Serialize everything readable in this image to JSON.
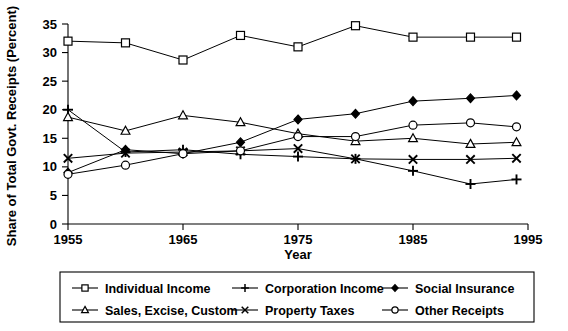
{
  "chart_data": {
    "type": "line",
    "title": "",
    "xlabel": "Year",
    "ylabel": "Share of Total Govt. Receipts (Percent)",
    "xlim": [
      1955,
      1995
    ],
    "ylim": [
      0,
      35
    ],
    "xticks": [
      1955,
      1965,
      1975,
      1985,
      1995
    ],
    "yticks": [
      0,
      5,
      10,
      15,
      20,
      25,
      30,
      35
    ],
    "grid": false,
    "legend_position": "bottom",
    "x": [
      1955,
      1960,
      1965,
      1970,
      1975,
      1980,
      1985,
      1990,
      1994
    ],
    "series": [
      {
        "name": "Individual Income",
        "marker": "square-open",
        "values": [
          32.0,
          31.7,
          28.7,
          33.0,
          31.0,
          34.7,
          32.7,
          32.7,
          32.7
        ]
      },
      {
        "name": "Corporation Income",
        "marker": "plus",
        "values": [
          20.0,
          12.6,
          13.0,
          12.2,
          11.8,
          11.4,
          9.3,
          7.0,
          7.8
        ]
      },
      {
        "name": "Social Insurance",
        "marker": "diamond-solid",
        "values": [
          9.0,
          13.0,
          12.3,
          14.3,
          18.3,
          19.3,
          21.5,
          22.0,
          22.5
        ]
      },
      {
        "name": "Sales, Excise, Custom",
        "marker": "triangle-open",
        "values": [
          18.7,
          16.3,
          19.0,
          17.8,
          15.8,
          14.5,
          15.0,
          14.0,
          14.3
        ]
      },
      {
        "name": "Property Taxes",
        "marker": "cross",
        "values": [
          11.5,
          12.4,
          12.6,
          12.8,
          13.2,
          11.4,
          11.3,
          11.3,
          11.5
        ]
      },
      {
        "name": "Other Receipts",
        "marker": "circle-open",
        "values": [
          8.7,
          10.3,
          12.3,
          12.8,
          15.3,
          15.3,
          17.3,
          17.7,
          17.0
        ]
      }
    ]
  },
  "axis": {
    "y_title": "Share of Total Govt. Receipts (Percent)",
    "x_title": "Year",
    "x_tick_labels": [
      "1955",
      "1965",
      "1975",
      "1985",
      "1995"
    ],
    "y_tick_labels": [
      "0",
      "5",
      "10",
      "15",
      "20",
      "25",
      "30",
      "35"
    ]
  },
  "legend": {
    "entries": [
      {
        "label": "Individual Income",
        "marker": "square-open"
      },
      {
        "label": "Corporation Income",
        "marker": "plus"
      },
      {
        "label": "Social Insurance",
        "marker": "diamond-solid"
      },
      {
        "label": "Sales, Excise, Custom",
        "marker": "triangle-open"
      },
      {
        "label": "Property Taxes",
        "marker": "cross"
      },
      {
        "label": "Other Receipts",
        "marker": "circle-open"
      }
    ]
  },
  "colors": {
    "line": "#000000",
    "background": "#ffffff",
    "marker_fill": "#ffffff"
  }
}
